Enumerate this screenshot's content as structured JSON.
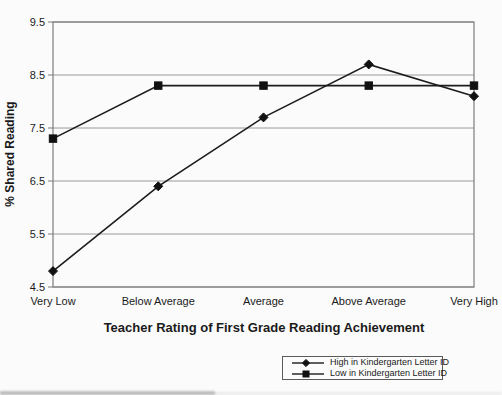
{
  "chart_data": {
    "type": "line",
    "title": "",
    "xlabel": "Teacher Rating of First Grade Reading Achievement",
    "ylabel": "% Shared Reading",
    "categories": [
      "Very Low",
      "Below Average",
      "Average",
      "Above Average",
      "Very High"
    ],
    "series": [
      {
        "name": "High in Kindergarten Letter ID",
        "marker": "diamond",
        "values": [
          4.8,
          6.4,
          7.7,
          8.7,
          8.1
        ]
      },
      {
        "name": "Low in Kindergarten Letter ID",
        "marker": "square",
        "values": [
          7.3,
          8.3,
          8.3,
          8.3,
          8.3
        ]
      }
    ],
    "ylim": [
      4.5,
      9.5
    ],
    "yticks": [
      "9.5",
      "8.5",
      "7.5",
      "6.5",
      "5.5",
      "4.5"
    ],
    "grid": "horizontal",
    "legend_position": "bottom-center",
    "colors": {
      "series_line": "#1c1c1c",
      "marker": "#111111",
      "gridline": "#9a9a9a",
      "plot_border": "#7d7d7d",
      "text": "#1a1a1a",
      "background": "#fbfbfb"
    }
  }
}
